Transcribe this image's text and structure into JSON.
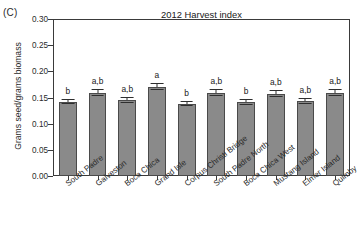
{
  "panel": {
    "label": "(C)"
  },
  "chart_data": {
    "type": "bar",
    "title": "2012 Harvest index",
    "xlabel": "",
    "ylabel": "Grams seed/grams biomass",
    "ylim": [
      0.0,
      0.3
    ],
    "ytick_labels": [
      "0.00",
      "0.05",
      "0.10",
      "0.15",
      "0.20",
      "0.25",
      "0.30"
    ],
    "ytick_values": [
      0.0,
      0.05,
      0.1,
      0.15,
      0.2,
      0.25,
      0.3
    ],
    "grid": false,
    "legend": "none",
    "bar_color": "#8a8a8a",
    "categories": [
      "South Padre",
      "Galveston",
      "Boca Chica",
      "Grand Isle",
      "Corpus Christi Bridge",
      "South Padre North",
      "Boca Chica West",
      "Mustang Island",
      "Elmer Island",
      "Quimby"
    ],
    "values": [
      0.142,
      0.159,
      0.145,
      0.17,
      0.137,
      0.158,
      0.141,
      0.157,
      0.143,
      0.159
    ],
    "errors": [
      0.004,
      0.006,
      0.005,
      0.006,
      0.004,
      0.006,
      0.005,
      0.006,
      0.005,
      0.006
    ],
    "significance_letters": [
      "b",
      "a,b",
      "a,b",
      "a",
      "b",
      "a,b",
      "b",
      "a,b",
      "a,b",
      "a,b"
    ]
  }
}
